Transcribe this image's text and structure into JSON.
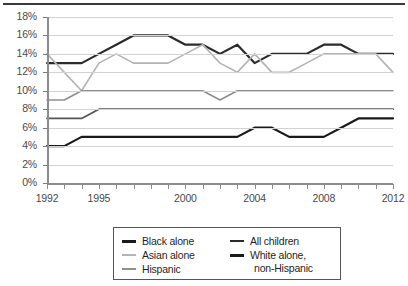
{
  "chart_data": {
    "type": "line",
    "title": "",
    "xlabel": "",
    "ylabel": "",
    "x": [
      1992,
      1993,
      1994,
      1995,
      1996,
      1997,
      1998,
      1999,
      2000,
      2001,
      2002,
      2003,
      2004,
      2005,
      2006,
      2007,
      2008,
      2009,
      2010,
      2011,
      2012
    ],
    "xlim": [
      1992,
      2012
    ],
    "ylim": [
      0,
      18
    ],
    "ytick_labels": [
      "0%",
      "2%",
      "4%",
      "6%",
      "8%",
      "10%",
      "12%",
      "14%",
      "16%",
      "18%"
    ],
    "ytick_values": [
      0,
      2,
      4,
      6,
      8,
      10,
      12,
      14,
      16,
      18
    ],
    "xtick_labels_shown": [
      "1992",
      "1995",
      "2000",
      "2004",
      "2008",
      "2012"
    ],
    "xtick_label_values": [
      1992,
      1995,
      2000,
      2004,
      2008,
      2012
    ],
    "grid": true,
    "legend_position": "below",
    "series": [
      {
        "name": "All children",
        "color": "#2b2b2b",
        "width": 2.2,
        "values": [
          13,
          13,
          13,
          14,
          15,
          16,
          16,
          16,
          15,
          15,
          14,
          15,
          13,
          14,
          14,
          14,
          15,
          15,
          14,
          14,
          14
        ]
      },
      {
        "name": "Asian alone",
        "color": "#b4b4b4",
        "width": 1.6,
        "values": [
          14,
          12,
          10,
          13,
          14,
          13,
          13,
          13,
          14,
          15,
          13,
          12,
          14,
          12,
          12,
          13,
          14,
          14,
          14,
          14,
          12
        ]
      },
      {
        "name": "Hispanic",
        "color": "#8e8e8e",
        "width": 1.6,
        "values": [
          9,
          9,
          10,
          10,
          10,
          10,
          10,
          10,
          10,
          10,
          9,
          10,
          10,
          10,
          10,
          10,
          10,
          10,
          10,
          10,
          10
        ]
      },
      {
        "name": "White alone, non-Hispanic",
        "color": "#555555",
        "width": 1.8,
        "values": [
          7,
          7,
          7,
          8,
          8,
          8,
          8,
          8,
          8,
          8,
          8,
          8,
          8,
          8,
          8,
          8,
          8,
          8,
          8,
          8,
          8
        ]
      },
      {
        "name": "Black alone",
        "color": "#1a1a1a",
        "width": 2.2,
        "values": [
          4,
          4,
          5,
          5,
          5,
          5,
          5,
          5,
          5,
          5,
          5,
          5,
          6,
          6,
          5,
          5,
          5,
          6,
          7,
          7,
          7
        ]
      }
    ]
  },
  "legend": {
    "items": [
      {
        "label": "Black alone",
        "color": "#1a1a1a",
        "thick": true
      },
      {
        "label": "Asian alone",
        "color": "#b4b4b4",
        "thick": false
      },
      {
        "label": "Hispanic",
        "color": "#8e8e8e",
        "thick": false
      },
      {
        "label": "All children",
        "color": "#2b2b2b",
        "thick": false
      },
      {
        "label": "White alone,",
        "color": "#1a1a1a",
        "thick": true
      }
    ],
    "white_second_line": "non-Hispanic"
  }
}
